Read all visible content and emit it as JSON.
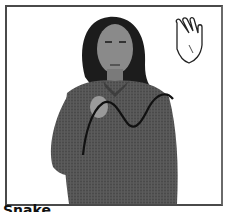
{
  "card": {
    "caption": "Snake",
    "handshape_icon": "open-hand-icon",
    "motion_path": "wavy-line",
    "colors": {
      "frame": "#4a4a4a",
      "background": "#ffffff",
      "shirt": "#4e4e4e",
      "path": "#111111"
    }
  }
}
